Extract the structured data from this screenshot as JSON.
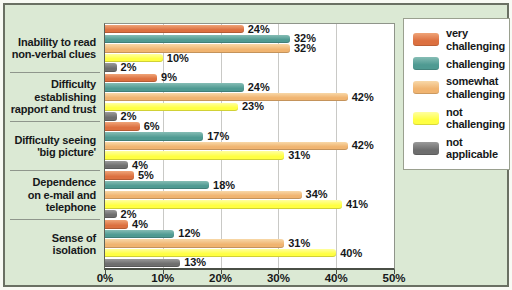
{
  "style": {
    "screen_bg": "#f8faf4",
    "panel_bg": "#dbe9d4",
    "frame_border": "#6a7063",
    "plot_bg": "#ffffff",
    "grid_line": "#c9c9c6",
    "axis_dark": "#4a4f46",
    "text_color": "#16181a"
  },
  "chart_data": {
    "type": "bar",
    "orientation": "horizontal",
    "title": "",
    "xlabel": "",
    "ylabel": "",
    "xlim": [
      0,
      50
    ],
    "x_tick_labels": [
      "0%",
      "10%",
      "20%",
      "30%",
      "40%",
      "50%"
    ],
    "grid": "vertical",
    "legend_position": "right",
    "value_suffix": "%",
    "categories": [
      "Inability to read non-verbal clues",
      "Difficulty establishing rapport and trust",
      "Difficulty seeing 'big picture'",
      "Dependence on e-mail and telephone",
      "Sense of isolation"
    ],
    "category_display_lines": [
      [
        "Inability to read",
        "non-verbal clues"
      ],
      [
        "Difficulty",
        "establishing",
        "rapport and trust"
      ],
      [
        "Difficulty seeing",
        "'big picture'"
      ],
      [
        "Dependence",
        "on e-mail and",
        "telephone"
      ],
      [
        "Sense of",
        "isolation"
      ]
    ],
    "series": [
      {
        "name": "very challenging",
        "legend_display_lines": [
          "very",
          "challenging"
        ],
        "color": "#dc7040",
        "color_light": "#efa478",
        "values": [
          24,
          9,
          6,
          5,
          4
        ]
      },
      {
        "name": "challenging",
        "legend_display_lines": [
          "challenging"
        ],
        "color": "#4f9a92",
        "color_light": "#86bdb5",
        "values": [
          32,
          24,
          17,
          18,
          12
        ]
      },
      {
        "name": "somewhat challenging",
        "legend_display_lines": [
          "somewhat",
          "challenging"
        ],
        "color": "#f0b470",
        "color_light": "#f8d8a8",
        "values": [
          32,
          42,
          42,
          34,
          31
        ]
      },
      {
        "name": "not challenging",
        "legend_display_lines": [
          "not",
          "challenging"
        ],
        "color": "#ffff42",
        "color_light": "#ffffa0",
        "values": [
          10,
          23,
          31,
          41,
          40
        ]
      },
      {
        "name": "not applicable",
        "legend_display_lines": [
          "not",
          "applicable"
        ],
        "color": "#6e6e6e",
        "color_light": "#9a9a9a",
        "values": [
          2,
          2,
          4,
          2,
          13
        ]
      }
    ]
  }
}
